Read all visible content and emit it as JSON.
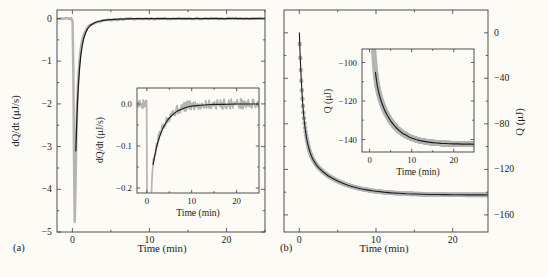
{
  "figure": {
    "background": "#fcfbf6",
    "frame_color": "#3d3d3d",
    "text_color": "#222222",
    "data_gray": "#b4b4b4",
    "fit_black": "#1c1c1c",
    "panel_a": {
      "tag": "(a)"
    },
    "panel_b": {
      "tag": "(b)"
    }
  },
  "datasets": {
    "a_main_meas": [
      [
        -2,
        0
      ],
      [
        -1.2,
        0.005
      ],
      [
        -0.6,
        -0.003
      ],
      [
        -0.15,
        0.002
      ],
      [
        0.02,
        -0.05
      ],
      [
        0.12,
        -1.2
      ],
      [
        0.22,
        -3.4
      ],
      [
        0.3,
        -4.75
      ],
      [
        0.4,
        -3.9
      ],
      [
        0.5,
        -2.85
      ],
      [
        0.62,
        -2.0
      ],
      [
        0.75,
        -1.45
      ],
      [
        0.9,
        -1.02
      ],
      [
        1.05,
        -0.75
      ],
      [
        1.25,
        -0.52
      ],
      [
        1.5,
        -0.36
      ],
      [
        1.8,
        -0.25
      ],
      [
        2.1,
        -0.18
      ],
      [
        2.5,
        -0.13
      ],
      [
        3,
        -0.09
      ],
      [
        3.5,
        -0.068
      ],
      [
        4,
        -0.052
      ],
      [
        4.5,
        -0.04
      ],
      [
        5,
        -0.032
      ],
      [
        6,
        -0.02
      ],
      [
        7,
        -0.013
      ],
      [
        8,
        -0.009
      ],
      [
        9,
        -0.006
      ],
      [
        10,
        -0.004
      ],
      [
        12,
        -0.002
      ],
      [
        14,
        -0.001
      ],
      [
        17,
        -0.001
      ],
      [
        20,
        0
      ],
      [
        25,
        0
      ]
    ],
    "a_main_fit": [
      [
        0.45,
        -3.1
      ],
      [
        0.55,
        -2.5
      ],
      [
        0.65,
        -2.0
      ],
      [
        0.78,
        -1.55
      ],
      [
        0.92,
        -1.18
      ],
      [
        1.08,
        -0.88
      ],
      [
        1.25,
        -0.66
      ],
      [
        1.45,
        -0.48
      ],
      [
        1.7,
        -0.34
      ],
      [
        2,
        -0.23
      ],
      [
        2.35,
        -0.16
      ],
      [
        2.75,
        -0.11
      ],
      [
        3.2,
        -0.075
      ],
      [
        3.7,
        -0.052
      ],
      [
        4.3,
        -0.035
      ],
      [
        5,
        -0.023
      ],
      [
        6,
        -0.013
      ],
      [
        7,
        -0.008
      ],
      [
        8.5,
        -0.004
      ],
      [
        10,
        -0.002
      ],
      [
        13,
        -0.001
      ],
      [
        25,
        0
      ]
    ],
    "a_inset_meas": [
      [
        -2,
        0
      ],
      [
        -1,
        0
      ],
      [
        -0.3,
        0.005
      ],
      [
        -0.05,
        0
      ],
      [
        0.05,
        -0.25
      ],
      [
        0.5,
        -0.28
      ],
      [
        0.95,
        -0.26
      ],
      [
        1.1,
        -0.19
      ],
      [
        1.25,
        -0.16
      ],
      [
        1.45,
        -0.142
      ],
      [
        1.7,
        -0.125
      ],
      [
        2,
        -0.108
      ],
      [
        2.3,
        -0.094
      ],
      [
        2.7,
        -0.079
      ],
      [
        3.1,
        -0.066
      ],
      [
        3.6,
        -0.053
      ],
      [
        4.1,
        -0.043
      ],
      [
        4.6,
        -0.035
      ],
      [
        5.2,
        -0.027
      ],
      [
        5.8,
        -0.021
      ],
      [
        6.5,
        -0.016
      ],
      [
        7.2,
        -0.012
      ],
      [
        8,
        -0.008
      ],
      [
        9,
        -0.005
      ],
      [
        10,
        -0.004
      ],
      [
        11,
        -0.003
      ],
      [
        12.5,
        -0.002
      ],
      [
        14,
        -0.001
      ],
      [
        16,
        -0.001
      ],
      [
        18,
        0
      ],
      [
        20,
        0.001
      ],
      [
        22,
        0
      ],
      [
        25,
        0
      ]
    ],
    "a_inset_fit": [
      [
        1.4,
        -0.144
      ],
      [
        1.65,
        -0.129
      ],
      [
        1.95,
        -0.113
      ],
      [
        2.3,
        -0.097
      ],
      [
        2.7,
        -0.082
      ],
      [
        3.1,
        -0.07
      ],
      [
        3.6,
        -0.057
      ],
      [
        4.1,
        -0.047
      ],
      [
        4.7,
        -0.037
      ],
      [
        5.3,
        -0.03
      ],
      [
        6,
        -0.023
      ],
      [
        6.8,
        -0.017
      ],
      [
        7.6,
        -0.013
      ],
      [
        8.5,
        -0.009
      ],
      [
        9.5,
        -0.006
      ],
      [
        10.5,
        -0.0045
      ],
      [
        12,
        -0.003
      ],
      [
        13.5,
        -0.002
      ],
      [
        15,
        -0.001
      ],
      [
        17,
        -0.001
      ],
      [
        20,
        0
      ],
      [
        25,
        0
      ]
    ],
    "b_q": [
      [
        0,
        0
      ],
      [
        0.05,
        -9.8
      ],
      [
        0.1,
        -18.8
      ],
      [
        0.15,
        -26.9
      ],
      [
        0.2,
        -34.3
      ],
      [
        0.25,
        -41
      ],
      [
        0.3,
        -47.2
      ],
      [
        0.35,
        -52.8
      ],
      [
        0.4,
        -57.9
      ],
      [
        0.45,
        -62.6
      ],
      [
        0.5,
        -66.9
      ],
      [
        0.55,
        -70.8
      ],
      [
        0.6,
        -74.4
      ],
      [
        0.65,
        -77.7
      ],
      [
        0.7,
        -80.7
      ],
      [
        0.75,
        -83.4
      ],
      [
        0.8,
        -86
      ],
      [
        0.85,
        -88.4
      ],
      [
        0.9,
        -90.6
      ],
      [
        0.95,
        -92.5
      ],
      [
        1,
        -94.4
      ],
      [
        1.1,
        -97.7
      ],
      [
        1.2,
        -100.5
      ],
      [
        1.3,
        -103
      ],
      [
        1.4,
        -105.1
      ],
      [
        1.5,
        -107
      ],
      [
        1.6,
        -108.6
      ],
      [
        1.8,
        -111.6
      ],
      [
        2,
        -113.8
      ],
      [
        2.2,
        -115.8
      ],
      [
        2.4,
        -117.5
      ],
      [
        2.6,
        -119.1
      ],
      [
        2.8,
        -120.3
      ],
      [
        3,
        -121.6
      ],
      [
        3.4,
        -123.8
      ],
      [
        3.8,
        -125.8
      ],
      [
        4.2,
        -127.4
      ],
      [
        4.6,
        -128.9
      ],
      [
        5,
        -130.3
      ],
      [
        5.5,
        -131.8
      ],
      [
        6,
        -133.1
      ],
      [
        6.5,
        -134.3
      ],
      [
        7,
        -135.3
      ],
      [
        7.5,
        -136.2
      ],
      [
        8,
        -137
      ],
      [
        8.5,
        -137.6
      ],
      [
        9,
        -138.2
      ],
      [
        9.5,
        -138.8
      ],
      [
        10,
        -139.2
      ],
      [
        11,
        -140
      ],
      [
        12,
        -140.6
      ],
      [
        13,
        -141
      ],
      [
        14,
        -141.4
      ],
      [
        15,
        -141.6
      ],
      [
        16,
        -141.8
      ],
      [
        17,
        -142
      ],
      [
        18,
        -142.1
      ],
      [
        19,
        -142.2
      ],
      [
        20,
        -142.3
      ],
      [
        21,
        -142.3
      ],
      [
        22,
        -142.4
      ],
      [
        23,
        -142.4
      ],
      [
        24,
        -142.4
      ],
      [
        25,
        -142.5
      ]
    ]
  },
  "chart_data": [
    {
      "id": "panel-a",
      "type": "line",
      "box": [
        57,
        10,
        265,
        232
      ],
      "xlim": [
        -2,
        25
      ],
      "ylim": [
        -5,
        0.2
      ],
      "xticks": {
        "values": [
          0,
          10,
          20
        ],
        "labels": [
          "0",
          "10",
          "20"
        ],
        "minor": [
          5,
          15,
          25
        ],
        "label_side": "bottom"
      },
      "yticks": {
        "values": [
          0,
          -1,
          -2,
          -3,
          -4,
          -5
        ],
        "labels": [
          "0",
          "−1",
          "−2",
          "−3",
          "−4",
          "−5"
        ],
        "minor": [
          -0.5,
          -1.5,
          -2.5,
          -3.5,
          -4.5
        ],
        "label_side": "left"
      },
      "xlabel": "Time (min)",
      "xlabel_pos": [
        162,
        252
      ],
      "ylabel": "dQ/dt (μJ/s)",
      "ylabel_pos": [
        19,
        121
      ],
      "tick_len": [
        4,
        2.2
      ],
      "font_size": 9.8,
      "label_font_size": 10.8,
      "series": [
        {
          "name": "measured-trace",
          "kind": "noisyline",
          "data": "a_main_meas",
          "color": "#b4b4b4",
          "width": 2.5,
          "amplitude": 0.016,
          "step": 0.25,
          "seed": 11
        },
        {
          "name": "exponential-fit",
          "kind": "line",
          "data": "a_main_fit",
          "color": "#1c1c1c",
          "width": 1.25
        }
      ]
    },
    {
      "id": "inset-a",
      "type": "line",
      "opaque": true,
      "box": [
        137,
        88,
        259,
        193
      ],
      "xlim": [
        -2.2,
        25
      ],
      "ylim": [
        -0.212,
        0.038
      ],
      "xticks": {
        "values": [
          0,
          10,
          20
        ],
        "labels": [
          "0",
          "10",
          "20"
        ],
        "minor": [
          5,
          15
        ],
        "label_side": "bottom"
      },
      "yticks": {
        "values": [
          0,
          -0.1,
          -0.2
        ],
        "labels": [
          "0.0",
          "−0.1",
          "−0.2"
        ],
        "minor": [
          -0.05,
          -0.15
        ],
        "label_side": "left"
      },
      "xlabel": "Time (min)",
      "xlabel_pos": [
        198,
        216
      ],
      "ylabel": "dQ/dt (μJ/s)",
      "ylabel_pos": [
        103,
        140
      ],
      "tick_len": [
        3.2,
        1.8
      ],
      "font_size": 8.8,
      "label_font_size": 9.6,
      "series": [
        {
          "name": "measured-trace",
          "kind": "noisyline",
          "data": "a_inset_meas",
          "color": "#b4b4b4",
          "width": 1.7,
          "amplitude": 0.012,
          "step": 0.13,
          "seed": 5
        },
        {
          "name": "exponential-fit",
          "kind": "line",
          "data": "a_inset_fit",
          "color": "#1c1c1c",
          "width": 1.15
        }
      ]
    },
    {
      "id": "panel-b",
      "type": "scatter",
      "box": [
        284,
        10,
        488,
        232
      ],
      "xlim": [
        -2,
        24.6
      ],
      "ylim": [
        -175,
        20
      ],
      "xticks": {
        "values": [
          0,
          10,
          20
        ],
        "labels": [
          "0",
          "10",
          "20"
        ],
        "minor": [
          5,
          15
        ],
        "label_side": "bottom"
      },
      "yticks": {
        "values": [
          0,
          -40,
          -80,
          -120,
          -160
        ],
        "labels": [
          "0",
          "−40",
          "−80",
          "−120",
          "−160"
        ],
        "minor": [
          -20,
          -60,
          -100,
          -140
        ],
        "label_side": "right"
      },
      "xlabel": "Time (min)",
      "xlabel_pos": [
        384,
        252
      ],
      "ylabel": "Q (μJ)",
      "ylabel_pos": [
        523,
        122
      ],
      "tick_len": [
        4,
        2.2
      ],
      "font_size": 9.8,
      "label_font_size": 10.8,
      "series": [
        {
          "name": "heat-data-markers",
          "kind": "markerband",
          "data": "b_q",
          "color": "#b4b4b4",
          "radius": 2.3,
          "dt": 0.07,
          "t0": 0.05
        },
        {
          "name": "exponential-fit",
          "kind": "line",
          "data": "b_q",
          "color": "#1c1c1c",
          "width": 1.1
        }
      ]
    },
    {
      "id": "inset-b",
      "type": "scatter",
      "opaque": true,
      "box": [
        362,
        49,
        474,
        152
      ],
      "xlim": [
        -1.8,
        24.8
      ],
      "ylim": [
        -146.5,
        -93
      ],
      "xticks": {
        "values": [
          0,
          10,
          20
        ],
        "labels": [
          "0",
          "10",
          "20"
        ],
        "minor": [
          5,
          15
        ],
        "label_side": "bottom"
      },
      "yticks": {
        "values": [
          -100,
          -120,
          -140
        ],
        "labels": [
          "−100",
          "−120",
          "−140"
        ],
        "minor": [
          -110,
          -130
        ],
        "label_side": "left"
      },
      "xlabel": "Time (min)",
      "xlabel_pos": [
        418,
        175
      ],
      "ylabel": "Q (μJ)",
      "ylabel_pos": [
        331,
        101
      ],
      "tick_len": [
        3.2,
        1.8
      ],
      "font_size": 8.8,
      "label_font_size": 9.6,
      "series": [
        {
          "name": "heat-data-markers",
          "kind": "markerband",
          "data": "b_q",
          "color": "#b4b4b4",
          "radius": 2.9,
          "dt": 0.06,
          "t0": 0.05
        },
        {
          "name": "exponential-fit",
          "kind": "line",
          "data": "b_q",
          "color": "#1c1c1c",
          "width": 1.15,
          "tmin": 1.4
        }
      ]
    }
  ]
}
